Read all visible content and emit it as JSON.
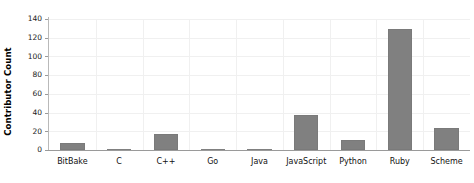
{
  "chart_data": {
    "type": "bar",
    "title": "",
    "xlabel": "",
    "ylabel": "Contributor Count",
    "categories": [
      "BitBake",
      "C",
      "C++",
      "Go",
      "Java",
      "JavaScript",
      "Python",
      "Ruby",
      "Scheme"
    ],
    "values": [
      7,
      1,
      17,
      1,
      1,
      37,
      11,
      129,
      24
    ],
    "ylim": [
      0,
      140
    ],
    "yticks": [
      0,
      20,
      40,
      60,
      80,
      100,
      120,
      140
    ],
    "ytick_labels": [
      "0",
      "20",
      "40",
      "60",
      "80",
      "100",
      "120",
      "140"
    ],
    "grid": true,
    "grid_axis": "both",
    "legend": false,
    "bar_color": "#808080",
    "grid_color": "#f0f0f0",
    "axis_color": "#9a9a9a",
    "background_color": "#ffffff"
  }
}
